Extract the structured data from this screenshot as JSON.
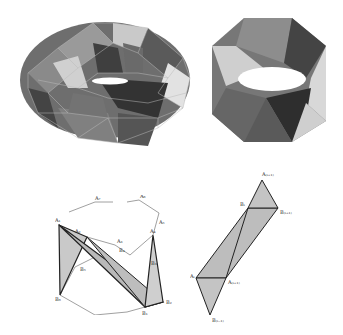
{
  "figure": {
    "panels": [
      {
        "id": "torus",
        "description": "Triangulated torus mesh with shaded faces"
      },
      {
        "id": "twisted-band",
        "description": "Octagonal twisted band (Möbius-like) triangulated polyhedron"
      },
      {
        "id": "band-construction",
        "description": "Construction of twisted band between two polygons A and B"
      },
      {
        "id": "strip-detail",
        "description": "Detail of triangle strip between A and B vertices"
      }
    ],
    "labels_left": {
      "A1": "A₁",
      "A2": "A₂",
      "A3": "A₃",
      "A4": "A₄",
      "A5": "A₅",
      "A6": "A₆",
      "A7": "A₇",
      "B1": "B₁",
      "B2": "B₂",
      "B3": "B₃",
      "B4": "B₄",
      "B5": "B₅",
      "B6": "B₆",
      "B7": "B₇"
    },
    "labels_right": {
      "Ai": "Aᵢ",
      "Ap1": "A₍ᵢ₊₁₎",
      "Ap2": "A₍ᵢ₊₁₎",
      "Bi": "Bᵢ",
      "Bp1": "B₍ᵢ₊₁₎",
      "Bm1": "B₍ᵢ₋₁₎"
    }
  }
}
